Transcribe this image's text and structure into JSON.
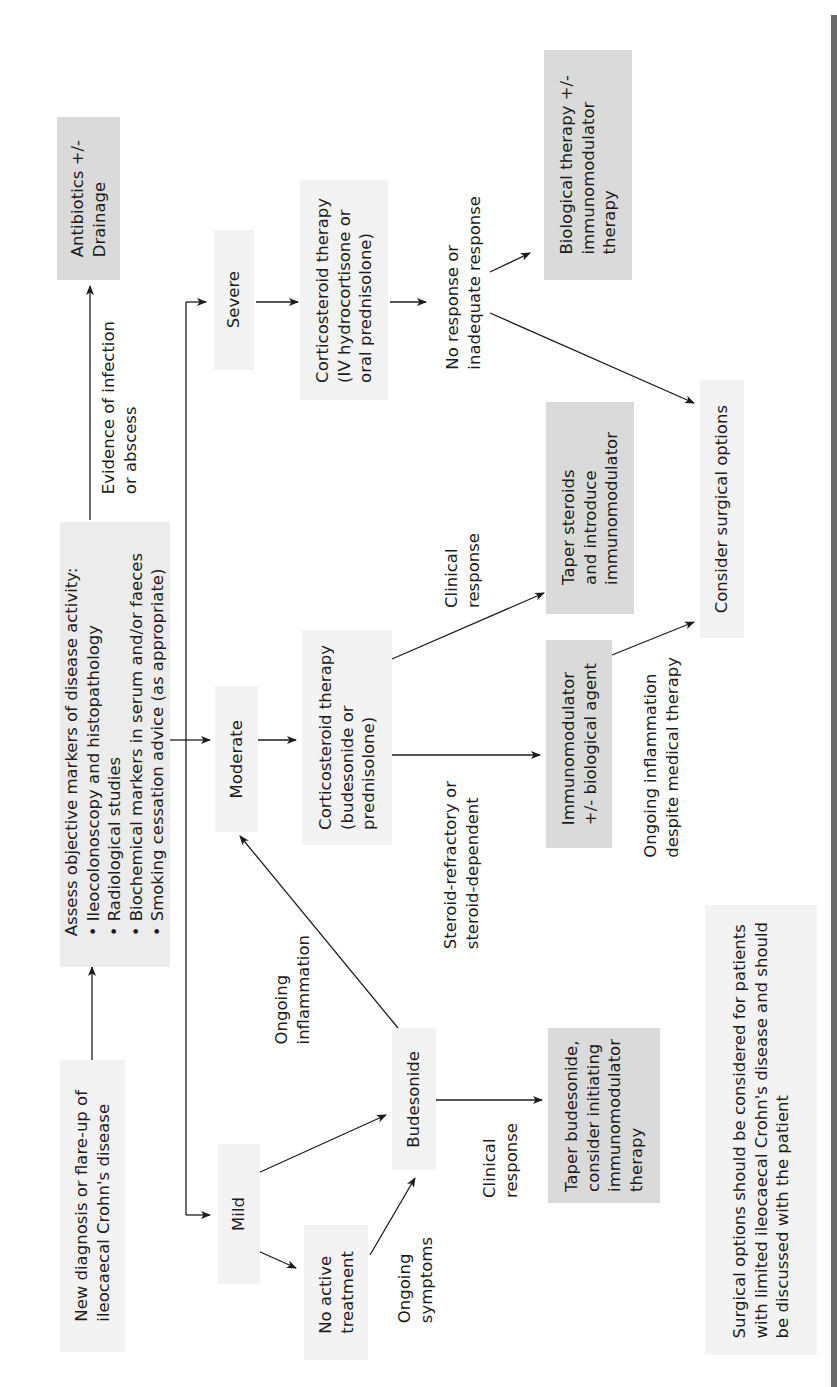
{
  "diagram": {
    "colors": {
      "box_fill": "#ececec",
      "box_fill_dark": "#dadada",
      "line": "#1c1c1c",
      "edge_bar": "#6a6a6a"
    },
    "nodes": {
      "start": "New diagnosis or flare-up of\nileocaecal Crohn's disease",
      "assess": {
        "heading": "Assess objective markers of disease activity:",
        "bullets": [
          "• Ileocolonoscopy and histopathology",
          "• Radiological studies",
          "• Biochemical markers in serum and/or faeces",
          "• Smoking cessation advice (as appropriate)"
        ]
      },
      "antibiotics": "Antibiotics +/-\nDrainage",
      "mild": "Mild",
      "moderate": "Moderate",
      "severe": "Severe",
      "no_active_treatment": "No active\ntreatment",
      "budesonide": "Budesonide",
      "taper_budesonide": "Taper budesonide,\nconsider initiating\nimmunomodulator\ntherapy",
      "corticosteroid_moderate": "Corticosteroid therapy\n(budesonide or\nprednisolone)",
      "corticosteroid_severe": "Corticosteroid therapy\n(IV hydrocortisone or\noral prednisolone)",
      "taper_steroids": "Taper steroids\nand introduce\nimmunomodulator",
      "immunomodulator": "Immunomodulator\n+/- biological agent",
      "biological": "Biological therapy +/-\nimmunomodulator\ntherapy",
      "surgical": "Consider surgical options",
      "note": "Surgical options should be considered for patients\nwith limited ileocaecal Crohn's disease and should\nbe discussed with the patient"
    },
    "edge_labels": {
      "infection": "Evidence of infection\nor abscess",
      "ongoing_inflammation": "Ongoing\ninflammation",
      "ongoing_symptoms": "Ongoing\nsymptoms",
      "clinical_response_mild": "Clinical\nresponse",
      "clinical_response_moderate": "Clinical\nresponse",
      "steroid_refractory": "Steroid-refractory or\nsteroid-dependent",
      "no_response": "No response or\ninadequate response",
      "ongoing_despite": "Ongoing inflammation\ndespite medical therapy"
    },
    "edges": [
      {
        "from": "start",
        "to": "assess"
      },
      {
        "from": "assess",
        "to": "antibiotics",
        "label": "infection"
      },
      {
        "from": "assess",
        "to": "mild"
      },
      {
        "from": "assess",
        "to": "moderate"
      },
      {
        "from": "assess",
        "to": "severe"
      },
      {
        "from": "mild",
        "to": "budesonide"
      },
      {
        "from": "mild",
        "to": "no_active_treatment"
      },
      {
        "from": "no_active_treatment",
        "to": "budesonide",
        "label": "ongoing_symptoms"
      },
      {
        "from": "budesonide",
        "to": "moderate",
        "label": "ongoing_inflammation"
      },
      {
        "from": "budesonide",
        "to": "taper_budesonide",
        "label": "clinical_response_mild"
      },
      {
        "from": "moderate",
        "to": "corticosteroid_moderate"
      },
      {
        "from": "corticosteroid_moderate",
        "to": "taper_steroids",
        "label": "clinical_response_moderate"
      },
      {
        "from": "corticosteroid_moderate",
        "to": "immunomodulator",
        "label": "steroid_refractory"
      },
      {
        "from": "immunomodulator",
        "to": "surgical",
        "label": "ongoing_despite"
      },
      {
        "from": "severe",
        "to": "corticosteroid_severe"
      },
      {
        "from": "corticosteroid_severe",
        "to": "biological",
        "label": "no_response"
      },
      {
        "from": "corticosteroid_severe",
        "to": "surgical",
        "label": "no_response"
      }
    ]
  }
}
